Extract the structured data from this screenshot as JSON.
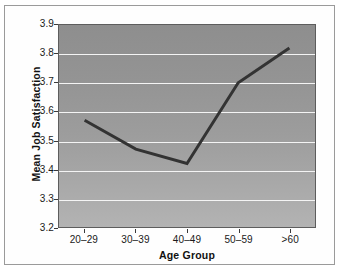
{
  "chart_data": {
    "type": "line",
    "title": "",
    "xlabel": "Age Group",
    "ylabel": "Mean Job Satisfaction",
    "categories": [
      "20–29",
      "30–39",
      "40–49",
      "50–59",
      ">60"
    ],
    "values": [
      3.57,
      3.47,
      3.42,
      3.7,
      3.82
    ],
    "series": [
      {
        "name": "Mean Job Satisfaction",
        "values": [
          3.57,
          3.47,
          3.42,
          3.7,
          3.82
        ]
      }
    ],
    "ylim": [
      3.2,
      3.9
    ],
    "ytick_step": 0.1,
    "ytick_labels": [
      "3.9",
      "3.8",
      "3.7",
      "3.6",
      "3.5",
      "3.4",
      "3.3",
      "3.2"
    ],
    "ytick_values": [
      3.9,
      3.8,
      3.7,
      3.6,
      3.5,
      3.4,
      3.3,
      3.2
    ],
    "grid": true,
    "grid_orientation": "horizontal",
    "legend": false,
    "legend_position": "none",
    "colors": {
      "line": "#333333",
      "gridline": "#f4f4f4",
      "plot_background_top": "#8e8e8e",
      "plot_background_bottom": "#b3b3b3",
      "plot_border": "#5d5d5d",
      "figure_border": "#9a9a9a",
      "figure_background": "#fefefe",
      "text": "#1a1a1a"
    }
  }
}
